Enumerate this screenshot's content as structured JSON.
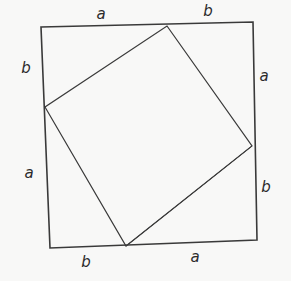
{
  "figure": {
    "background_color": "#f8f8f7",
    "stroke_color": "#3a3a3a",
    "label_color": "#2b2b2b",
    "canvas": {
      "width": 291,
      "height": 281
    }
  },
  "outer_square": {
    "name": "outer-square",
    "stroke_width": 1.6,
    "points": "41,27 253,22 257,240 50,248",
    "vertices": [
      {
        "name": "outer-top-left",
        "x": 41,
        "y": 27
      },
      {
        "name": "outer-top-right",
        "x": 253,
        "y": 22
      },
      {
        "name": "outer-bottom-right",
        "x": 257,
        "y": 240
      },
      {
        "name": "outer-bottom-left",
        "x": 50,
        "y": 248
      }
    ]
  },
  "inner_square": {
    "name": "inner-square",
    "stroke_width": 1.2,
    "points": "167,26 252,146 126,246 45,107",
    "vertices": [
      {
        "name": "inner-top",
        "x": 167,
        "y": 26
      },
      {
        "name": "inner-right",
        "x": 252,
        "y": 146
      },
      {
        "name": "inner-bottom",
        "x": 126,
        "y": 246
      },
      {
        "name": "inner-left",
        "x": 45,
        "y": 107
      }
    ]
  },
  "extra_lines": [
    {
      "name": "hypotenuse-bottom-right",
      "x1": 126,
      "y1": 246,
      "x2": 252,
      "y2": 146,
      "stroke_width": 0.9
    }
  ],
  "labels": [
    {
      "name": "label-top-a",
      "text": "a",
      "x": 101,
      "y": 14,
      "side": "top",
      "segment": "a"
    },
    {
      "name": "label-top-b",
      "text": "b",
      "x": 208,
      "y": 11,
      "side": "top",
      "segment": "b"
    },
    {
      "name": "label-left-b",
      "text": "b",
      "x": 26,
      "y": 68,
      "side": "left",
      "segment": "b"
    },
    {
      "name": "label-right-a",
      "text": "a",
      "x": 264,
      "y": 76,
      "side": "right",
      "segment": "a"
    },
    {
      "name": "label-left-a",
      "text": "a",
      "x": 29,
      "y": 173,
      "side": "left",
      "segment": "a"
    },
    {
      "name": "label-right-b",
      "text": "b",
      "x": 266,
      "y": 187,
      "side": "right",
      "segment": "b"
    },
    {
      "name": "label-bottom-b",
      "text": "b",
      "x": 86,
      "y": 262,
      "side": "bottom",
      "segment": "b"
    },
    {
      "name": "label-bottom-a",
      "text": "a",
      "x": 195,
      "y": 257,
      "side": "bottom",
      "segment": "a"
    }
  ]
}
